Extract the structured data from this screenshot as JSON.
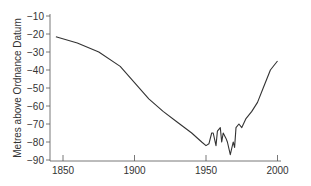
{
  "chart_data": {
    "type": "line",
    "title": "",
    "xlabel": "",
    "ylabel": "Metres above Ordnance Datum",
    "xlim": [
      1843,
      2002
    ],
    "ylim": [
      -90,
      -10
    ],
    "xticks": [
      1850,
      1900,
      1950,
      2000
    ],
    "yticks": [
      -10,
      -20,
      -30,
      -40,
      -50,
      -60,
      -70,
      -80,
      -90
    ],
    "grid": false,
    "legend": null,
    "series": [
      {
        "name": "water level",
        "x": [
          1845,
          1860,
          1875,
          1890,
          1900,
          1910,
          1920,
          1930,
          1940,
          1947,
          1950,
          1952,
          1954,
          1955,
          1957,
          1958,
          1960,
          1961,
          1962,
          1964,
          1965,
          1967,
          1969,
          1970,
          1971,
          1973,
          1975,
          1978,
          1982,
          1986,
          1990,
          1995,
          2000
        ],
        "values": [
          -21.5,
          -25,
          -30,
          -38,
          -47,
          -56,
          -63,
          -69,
          -75,
          -80,
          -82,
          -81,
          -75,
          -75,
          -82,
          -74,
          -72,
          -80,
          -75,
          -78,
          -80,
          -87,
          -80,
          -83,
          -72,
          -70,
          -72,
          -67,
          -63,
          -58,
          -50,
          -40,
          -35
        ]
      }
    ]
  },
  "axes": {
    "ylabel": "Metres above Ordnance Datum",
    "yticks": [
      "−10",
      "−20",
      "−30",
      "−40",
      "−50",
      "−60",
      "−70",
      "−80",
      "−90"
    ],
    "xticks": [
      "1850",
      "1900",
      "1950",
      "2000"
    ]
  }
}
